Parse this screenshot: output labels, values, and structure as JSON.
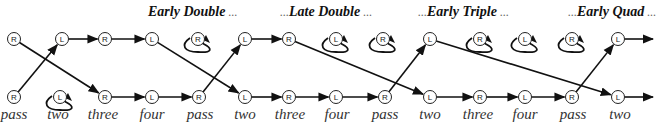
{
  "phases": [
    {
      "prefix": "",
      "name": "Early Double",
      "suffix": "...",
      "x": 148
    },
    {
      "prefix": "...",
      "name": "Late Double",
      "suffix": "...",
      "x": 280
    },
    {
      "prefix": "...",
      "name": "Early Triple",
      "suffix": "...",
      "x": 418
    },
    {
      "prefix": "...",
      "name": "Early Quad",
      "suffix": "...",
      "x": 568
    }
  ],
  "labels": [
    {
      "text": "pass",
      "x": 14
    },
    {
      "text": "two",
      "x": 58
    },
    {
      "text": "three",
      "x": 103
    },
    {
      "text": "four",
      "x": 152
    },
    {
      "text": "pass",
      "x": 200
    },
    {
      "text": "two",
      "x": 245
    },
    {
      "text": "three",
      "x": 290
    },
    {
      "text": "four",
      "x": 337
    },
    {
      "text": "pass",
      "x": 385
    },
    {
      "text": "two",
      "x": 430
    },
    {
      "text": "three",
      "x": 478
    },
    {
      "text": "four",
      "x": 525
    },
    {
      "text": "pass",
      "x": 573
    },
    {
      "text": "two",
      "x": 620
    }
  ],
  "nodes": {
    "top": [
      {
        "letter": "R",
        "x": 14,
        "loop": false
      },
      {
        "letter": "L",
        "x": 62,
        "loop": false
      },
      {
        "letter": "R",
        "x": 105,
        "loop": false
      },
      {
        "letter": "L",
        "x": 152,
        "loop": false
      },
      {
        "letter": "R",
        "x": 198,
        "loop": true
      },
      {
        "letter": "L",
        "x": 245,
        "loop": false
      },
      {
        "letter": "R",
        "x": 289,
        "loop": false
      },
      {
        "letter": "L",
        "x": 336,
        "loop": true
      },
      {
        "letter": "R",
        "x": 383,
        "loop": true
      },
      {
        "letter": "L",
        "x": 430,
        "loop": false
      },
      {
        "letter": "R",
        "x": 480,
        "loop": true
      },
      {
        "letter": "L",
        "x": 525,
        "loop": true
      },
      {
        "letter": "R",
        "x": 572,
        "loop": true
      },
      {
        "letter": "L",
        "x": 618,
        "loop": false
      }
    ],
    "bottom": [
      {
        "letter": "R",
        "x": 14,
        "loop": false
      },
      {
        "letter": "L",
        "x": 60,
        "loop": true
      },
      {
        "letter": "R",
        "x": 105,
        "loop": false
      },
      {
        "letter": "L",
        "x": 152,
        "loop": false
      },
      {
        "letter": "R",
        "x": 199,
        "loop": false
      },
      {
        "letter": "L",
        "x": 245,
        "loop": false
      },
      {
        "letter": "R",
        "x": 289,
        "loop": false
      },
      {
        "letter": "L",
        "x": 336,
        "loop": false
      },
      {
        "letter": "R",
        "x": 385,
        "loop": false
      },
      {
        "letter": "L",
        "x": 430,
        "loop": false
      },
      {
        "letter": "R",
        "x": 480,
        "loop": false
      },
      {
        "letter": "L",
        "x": 525,
        "loop": false
      },
      {
        "letter": "R",
        "x": 572,
        "loop": false
      },
      {
        "letter": "L",
        "x": 618,
        "loop": false
      }
    ]
  },
  "edges": [
    {
      "from": [
        "bottom",
        0
      ],
      "to": [
        "top",
        1
      ]
    },
    {
      "from": [
        "top",
        0
      ],
      "to": [
        "bottom",
        2
      ]
    },
    {
      "from": [
        "top",
        1
      ],
      "to": [
        "top",
        2
      ]
    },
    {
      "from": [
        "top",
        2
      ],
      "to": [
        "top",
        3
      ]
    },
    {
      "from": [
        "bottom",
        2
      ],
      "to": [
        "bottom",
        3
      ]
    },
    {
      "from": [
        "bottom",
        3
      ],
      "to": [
        "bottom",
        4
      ]
    },
    {
      "from": [
        "top",
        3
      ],
      "to": [
        "bottom",
        5
      ]
    },
    {
      "from": [
        "bottom",
        4
      ],
      "to": [
        "top",
        5
      ]
    },
    {
      "from": [
        "top",
        5
      ],
      "to": [
        "top",
        6
      ]
    },
    {
      "from": [
        "bottom",
        5
      ],
      "to": [
        "bottom",
        6
      ]
    },
    {
      "from": [
        "bottom",
        6
      ],
      "to": [
        "bottom",
        7
      ]
    },
    {
      "from": [
        "bottom",
        7
      ],
      "to": [
        "bottom",
        8
      ]
    },
    {
      "from": [
        "top",
        6
      ],
      "to": [
        "bottom",
        9
      ]
    },
    {
      "from": [
        "bottom",
        8
      ],
      "to": [
        "top",
        9
      ]
    },
    {
      "from": [
        "bottom",
        9
      ],
      "to": [
        "bottom",
        10
      ]
    },
    {
      "from": [
        "bottom",
        10
      ],
      "to": [
        "bottom",
        11
      ]
    },
    {
      "from": [
        "bottom",
        11
      ],
      "to": [
        "bottom",
        12
      ]
    },
    {
      "from": [
        "top",
        9
      ],
      "to": [
        "bottom",
        13
      ]
    },
    {
      "from": [
        "bottom",
        12
      ],
      "to": [
        "top",
        13
      ]
    },
    {
      "from": [
        "top",
        13
      ],
      "to": "out"
    },
    {
      "from": [
        "bottom",
        13
      ],
      "to": "out"
    }
  ],
  "colors": {
    "stroke": "#111111",
    "node_fill": "#ffffff",
    "label": "#333333"
  }
}
